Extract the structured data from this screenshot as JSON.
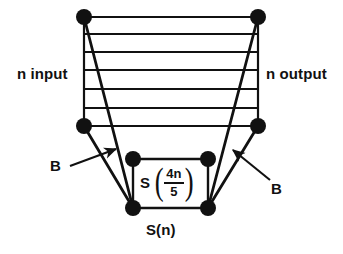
{
  "figure": {
    "type": "recursion-tree-band-diagram",
    "background_color": "#ffffff",
    "stroke_color": "#111111",
    "node_fill_color": "#111111",
    "labels": {
      "n_input": "n input",
      "n_output": "n output",
      "b_left": "B",
      "b_right": "B",
      "s_of_n": "S(n)"
    },
    "formula": {
      "function_name": "S",
      "left_paren": "(",
      "numerator": "4n",
      "denominator": "5",
      "right_paren": ")",
      "plain_text": "S(4n/5)"
    },
    "nodes": [
      {
        "name": "top-left",
        "x": 84,
        "y": 17
      },
      {
        "name": "top-right",
        "x": 258,
        "y": 17
      },
      {
        "name": "mid-left",
        "x": 84,
        "y": 126
      },
      {
        "name": "mid-right",
        "x": 258,
        "y": 126
      },
      {
        "name": "inner-top-left",
        "x": 133,
        "y": 159
      },
      {
        "name": "inner-top-right",
        "x": 208,
        "y": 159
      },
      {
        "name": "inner-bottom-left",
        "x": 133,
        "y": 208
      },
      {
        "name": "inner-bottom-right",
        "x": 208,
        "y": 208
      }
    ],
    "band_lines_y": [
      17,
      34,
      52,
      70,
      89,
      108,
      126
    ],
    "band_x_left": 84,
    "band_x_right": 258,
    "arrows": [
      {
        "name": "arrow-b-left",
        "x1": 70,
        "y1": 166,
        "x2": 118,
        "y2": 148
      },
      {
        "name": "arrow-b-right",
        "x1": 270,
        "y1": 180,
        "x2": 231,
        "y2": 149
      }
    ]
  }
}
